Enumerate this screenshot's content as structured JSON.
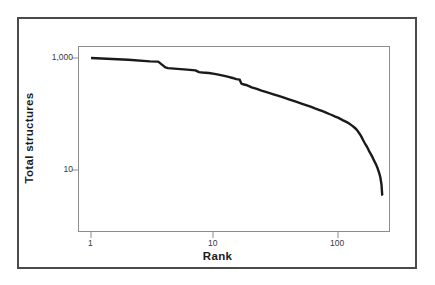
{
  "chart_data": {
    "type": "line",
    "title": "",
    "xlabel": "Rank",
    "ylabel": "Total structures",
    "xscale": "log",
    "yscale": "log",
    "xlim": [
      1,
      260
    ],
    "ylim": [
      2.8,
      1100
    ],
    "grid": false,
    "legend": null,
    "xtick_labels": [
      "1",
      "10",
      "100"
    ],
    "xtick_values": [
      1,
      10,
      100
    ],
    "ytick_labels": [
      "1,000",
      "10"
    ],
    "ytick_values": [
      1000,
      10
    ],
    "series": [
      {
        "name": "Total structures by rank",
        "color": "#1a1a1a",
        "x": [
          1,
          2,
          3,
          3.5,
          4,
          4.2,
          5,
          6,
          7,
          7.5,
          8,
          9,
          10,
          11,
          12,
          13,
          14,
          15,
          16,
          16.5,
          17,
          18,
          19,
          20,
          22,
          24,
          26,
          28,
          30,
          32,
          34,
          36,
          38,
          40,
          45,
          50,
          55,
          60,
          65,
          70,
          75,
          80,
          85,
          90,
          95,
          100,
          110,
          120,
          125,
          130,
          135,
          140,
          145,
          150,
          155,
          160,
          165,
          170,
          175,
          180,
          185,
          190,
          195,
          200,
          205,
          210,
          215,
          220,
          225,
          228,
          230
        ],
        "y": [
          1000,
          930,
          870,
          860,
          680,
          660,
          640,
          620,
          600,
          560,
          550,
          540,
          520,
          500,
          480,
          460,
          440,
          420,
          410,
          350,
          340,
          330,
          315,
          300,
          280,
          262,
          248,
          236,
          225,
          215,
          206,
          198,
          190,
          183,
          168,
          155,
          144,
          135,
          126,
          119,
          112,
          106,
          100,
          95,
          90,
          86,
          77,
          70,
          66,
          62,
          58,
          54,
          49,
          44,
          39,
          34,
          30,
          27,
          24,
          21,
          19,
          17,
          15,
          13.5,
          12,
          10.5,
          9,
          7.5,
          5.5,
          3.6,
          3.5
        ]
      }
    ]
  },
  "axis": {
    "x_title": "Rank",
    "y_title": "Total structures",
    "x_ticks": [
      "1",
      "10",
      "100"
    ],
    "y_ticks": [
      "1,000",
      "10"
    ]
  },
  "colors": {
    "line": "#1a1a1a",
    "plot_border": "#8d8d8d",
    "outer_border": "#4a4a4a",
    "tick_label": "#3a3a3a",
    "axis_title": "#1c1c1c",
    "background": "#ffffff"
  }
}
